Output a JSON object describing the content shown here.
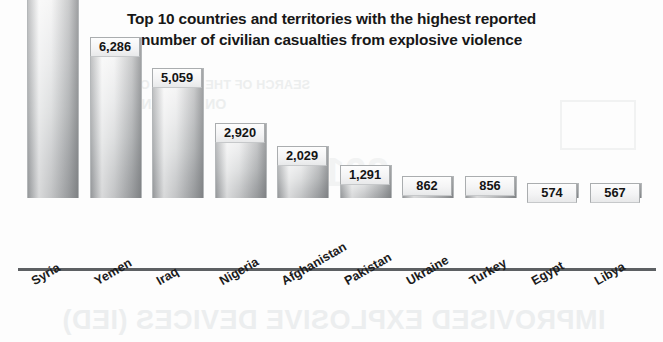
{
  "chart_data": {
    "type": "bar",
    "title": "Top 10 countries and territories with the highest reported number of civilian casualties from explosive violence",
    "title_lines": [
      "Top 10 countries and territories with the highest reported",
      "number of civilian casualties from explosive violence"
    ],
    "categories": [
      "Syria",
      "Yemen",
      "Iraq",
      "Nigeria",
      "Afghanistan",
      "Pakistan",
      "Ukraine",
      "Turkey",
      "Egypt",
      "Libya"
    ],
    "values": [
      8732,
      6286,
      5059,
      2920,
      2029,
      1291,
      862,
      856,
      574,
      567
    ],
    "value_labels": [
      "8,732",
      "6,286",
      "5,059",
      "2,920",
      "2,029",
      "1,291",
      "862",
      "856",
      "574",
      "567"
    ],
    "xlabel": "",
    "ylabel": "",
    "ylim": [
      0,
      8732
    ],
    "grid": false,
    "legend": false,
    "axis_visible": {
      "x": true,
      "y": false
    },
    "bar_style": "gray-vertical-gradient",
    "value_label_position": "inside-top",
    "category_label_rotation_deg": -30
  },
  "colors": {
    "background": "#fdfdfd",
    "title_text": "#171717",
    "axis_line": "#5d6063",
    "bar_border": "#b4b7b9",
    "bar_light": "#fbfbfb",
    "bar_dark": "#a9abad",
    "value_label_text": "#141414",
    "category_label_text": "#1b1b1b",
    "bleed_through": "#eceeee"
  },
  "artifacts": {
    "note": "faint mirrored bleed-through text from the reverse of the printed page",
    "bleed_top_line1": "SEARCH OF THE IMPACT OF",
    "bleed_top_line2": "ON CIVILIANS",
    "bleed_mid": "2015",
    "bleed_bottom": "IMPROVISED EXPLOSIVE DEVICES (IED)"
  }
}
